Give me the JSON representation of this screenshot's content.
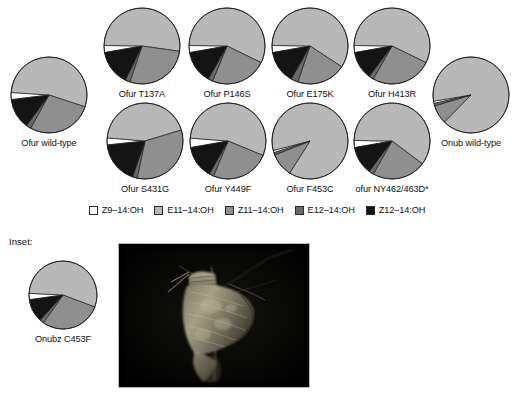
{
  "figure": {
    "inset_title": "Inset:"
  },
  "legend": {
    "items": [
      {
        "label": "Z9–14:OH",
        "color": "#ffffff"
      },
      {
        "label": "E11–14:OH",
        "color": "#b8b8b8"
      },
      {
        "label": "Z11–14:OH",
        "color": "#8f8f8f"
      },
      {
        "label": "E12–14:OH",
        "color": "#6a6a6a"
      },
      {
        "label": "Z12–14:OH",
        "color": "#141414"
      }
    ]
  },
  "chart_data": {
    "type": "pie",
    "legend_position": "below-charts",
    "categories": [
      "Z9–14:OH",
      "E11–14:OH",
      "Z11–14:OH",
      "E12–14:OH",
      "Z12–14:OH"
    ],
    "colors": [
      "#ffffff",
      "#b8b8b8",
      "#8f8f8f",
      "#6a6a6a",
      "#141414"
    ],
    "units": "percent",
    "series": [
      {
        "name": "Ofur wild-type",
        "label": "Ofur wild-type",
        "values": [
          3,
          54,
          28,
          2,
          13
        ]
      },
      {
        "name": "Ofur T137A",
        "label": "Ofur T137A",
        "values": [
          3,
          52,
          28,
          2,
          15
        ]
      },
      {
        "name": "Ofur P146S",
        "label": "Ofur P146S",
        "values": [
          3,
          57,
          24,
          2,
          14
        ]
      },
      {
        "name": "Ofur E175K",
        "label": "Ofur E175K",
        "values": [
          3,
          59,
          21,
          3,
          14
        ]
      },
      {
        "name": "Ofur H413R",
        "label": "Ofur H413R",
        "values": [
          3,
          57,
          26,
          2,
          12
        ]
      },
      {
        "name": "Ofur S431G",
        "label": "Ofur S431G",
        "values": [
          3,
          44,
          33,
          2,
          18
        ]
      },
      {
        "name": "Ofur Y449F",
        "label": "Ofur Y449F",
        "values": [
          4,
          55,
          25,
          2,
          14
        ]
      },
      {
        "name": "Ofur F453C",
        "label": "Ofur F453C",
        "values": [
          1,
          88,
          10,
          1,
          0
        ]
      },
      {
        "name": "ofur NY462/463D*",
        "label": "ofur NY462/463D*",
        "values": [
          3,
          60,
          23,
          2,
          12
        ]
      },
      {
        "name": "Onub wild-type",
        "label": "Onub wild-type",
        "values": [
          1,
          90,
          8,
          1,
          0
        ]
      },
      {
        "name": "Onubz C453F",
        "label": "Onubz C453F",
        "values": [
          3,
          55,
          29,
          2,
          11
        ]
      }
    ]
  },
  "layout": {
    "pies": [
      {
        "key": "Ofur wild-type",
        "x": 8,
        "y": 54,
        "r": 38,
        "rot": -97
      },
      {
        "key": "Ofur T137A",
        "x": 101,
        "y": 5,
        "r": 38,
        "rot": -100
      },
      {
        "key": "Ofur P146S",
        "x": 186,
        "y": 5,
        "r": 38,
        "rot": -100
      },
      {
        "key": "Ofur E175K",
        "x": 269,
        "y": 5,
        "r": 38,
        "rot": -100
      },
      {
        "key": "Ofur H413R",
        "x": 351,
        "y": 5,
        "r": 38,
        "rot": -100
      },
      {
        "key": "Ofur S431G",
        "x": 104,
        "y": 100,
        "r": 38,
        "rot": -96
      },
      {
        "key": "Ofur Y449F",
        "x": 187,
        "y": 100,
        "r": 38,
        "rot": -100
      },
      {
        "key": "Ofur F453C",
        "x": 269,
        "y": 100,
        "r": 38,
        "rot": -108
      },
      {
        "key": "ofur NY462/463D*",
        "x": 351,
        "y": 100,
        "r": 38,
        "rot": -100
      },
      {
        "key": "Onub wild-type",
        "x": 430,
        "y": 54,
        "r": 38,
        "rot": -103
      },
      {
        "key": "Onubz C453F",
        "x": 26,
        "y": 258,
        "r": 34,
        "rot": -98
      }
    ]
  },
  "photo": {
    "alt_name": "moth-photograph",
    "subject": "European corn borer moth on dark background"
  }
}
